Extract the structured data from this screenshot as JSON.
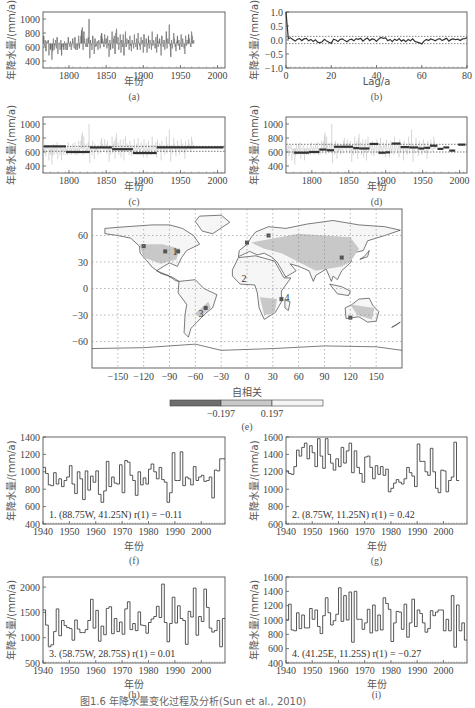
{
  "figure_caption": "图1.6  年降水量变化过程及分析(Sun et al., 2010)",
  "chart_data": [
    {
      "id": "a",
      "type": "bar",
      "subtitle": "(a)",
      "title": "",
      "xlabel": "年份",
      "ylabel": "年降水量/(mm/a)",
      "xlim": [
        1765,
        2010
      ],
      "ylim": [
        300,
        1100
      ],
      "xticks": [
        1800,
        1850,
        1900,
        1950,
        2000
      ],
      "yticks": [
        400,
        600,
        800,
        1000
      ],
      "baseline": 650,
      "x_start": 1766,
      "values": [
        760,
        620,
        700,
        540,
        680,
        660,
        700,
        480,
        640,
        560,
        580,
        420,
        540,
        720,
        560,
        620,
        700,
        580,
        740,
        500,
        640,
        660,
        560,
        700,
        480,
        640,
        600,
        560,
        680,
        620,
        560,
        660,
        560,
        740,
        640,
        600,
        680,
        560,
        620,
        720,
        660,
        580,
        740,
        560,
        640,
        560,
        620,
        760,
        580,
        660,
        760,
        840,
        880,
        560,
        820,
        720,
        640,
        600,
        720,
        600,
        740,
        1000,
        440,
        700,
        620,
        560,
        760,
        640,
        500,
        720,
        600,
        620,
        680,
        560,
        700,
        660,
        580,
        760,
        800,
        720,
        680,
        600,
        780,
        640,
        720,
        580,
        760,
        620,
        460,
        700,
        560,
        660,
        820,
        580,
        720,
        760,
        500,
        800,
        860,
        640,
        740,
        560,
        640,
        780,
        520,
        700,
        600,
        780,
        480,
        660,
        820,
        600,
        720,
        640,
        700,
        560,
        760,
        620,
        540,
        700,
        660,
        580,
        780,
        640,
        600,
        720,
        560,
        800,
        680,
        620,
        560,
        740,
        640,
        700,
        520,
        780,
        600,
        660,
        720,
        520,
        620,
        760,
        580,
        700,
        640,
        560,
        820,
        620,
        700,
        660,
        580,
        740,
        520,
        780,
        600,
        680,
        720,
        620,
        480,
        760,
        660,
        600,
        700,
        560,
        640,
        820,
        580,
        720,
        660,
        920,
        620,
        460,
        700,
        580,
        660,
        800,
        720,
        600,
        540,
        680,
        760,
        620,
        700,
        560,
        640,
        780,
        600,
        720,
        660,
        580,
        500,
        760,
        620,
        700,
        640,
        780,
        720,
        640,
        600,
        820,
        760,
        680,
        700
      ]
    },
    {
      "id": "b",
      "type": "line",
      "subtitle": "(b)",
      "title": "",
      "xlabel": "Lag/a",
      "ylabel": "年降水量/(mm/a)",
      "xlim": [
        0,
        80
      ],
      "ylim": [
        -1.0,
        1.0
      ],
      "xticks": [
        0,
        20,
        40,
        60,
        80
      ],
      "yticks": [
        -1.0,
        -0.5,
        0.0,
        0.5,
        1.0
      ],
      "ytick_labels": [
        "−1.0",
        "−0.5",
        "0.0",
        "0.5",
        "1.0"
      ],
      "confidence_band": [
        -0.13,
        0.13
      ],
      "values": [
        1.0,
        0.05,
        0.08,
        0.02,
        -0.04,
        0.03,
        0.05,
        -0.02,
        0.04,
        0.06,
        -0.03,
        0.02,
        -0.05,
        0.01,
        -0.08,
        -0.1,
        -0.06,
        0.02,
        -0.04,
        -0.08,
        -0.12,
        0.03,
        0.0,
        -0.05,
        0.02,
        0.04,
        -0.02,
        -0.06,
        0.01,
        0.03,
        -0.03,
        0.05,
        0.02,
        0.06,
        -0.04,
        0.03,
        0.07,
        -0.02,
        0.04,
        0.02,
        -0.05,
        0.04,
        0.09,
        0.06,
        0.08,
        -0.03,
        0.02,
        -0.06,
        0.03,
        -0.02,
        0.05,
        -0.04,
        0.01,
        -0.06,
        0.02,
        -0.03,
        0.04,
        -0.05,
        -0.08,
        -0.1,
        -0.14,
        -0.04,
        0.02,
        -0.02,
        0.04,
        0.01,
        -0.03,
        0.03,
        0.05,
        -0.02,
        0.02,
        0.06,
        -0.04,
        0.02,
        0.04,
        0.01,
        0.03,
        -0.02,
        0.04,
        0.05,
        0.08
      ]
    },
    {
      "id": "c",
      "type": "bar",
      "subtitle": "(c)",
      "xlabel": "年份",
      "ylabel": "年降水量/(mm/a)",
      "xlim": [
        1765,
        2010
      ],
      "ylim": [
        300,
        1100
      ],
      "xticks": [
        1800,
        1850,
        1900,
        1950,
        2000
      ],
      "yticks": [
        400,
        600,
        800,
        1000
      ],
      "reference_lines": [
        610,
        680
      ],
      "segments": [
        {
          "x0": 1766,
          "x1": 1796,
          "mean": 680
        },
        {
          "x0": 1796,
          "x1": 1828,
          "mean": 600
        },
        {
          "x0": 1828,
          "x1": 1858,
          "mean": 665
        },
        {
          "x0": 1858,
          "x1": 1886,
          "mean": 640
        },
        {
          "x0": 1886,
          "x1": 1918,
          "mean": 585
        },
        {
          "x0": 1918,
          "x1": 2008,
          "mean": 665
        }
      ]
    },
    {
      "id": "d",
      "type": "bar",
      "subtitle": "(d)",
      "xlabel": "年份",
      "ylabel": "年降水量/(mm/a)",
      "xlim": [
        1765,
        2010
      ],
      "ylim": [
        300,
        1100
      ],
      "xticks": [
        1800,
        1850,
        1900,
        1950,
        2000
      ],
      "yticks": [
        400,
        600,
        800,
        1000
      ],
      "reference_lines": [
        600,
        710
      ],
      "segments": [
        {
          "x0": 1776,
          "x1": 1796,
          "mean": 590
        },
        {
          "x0": 1796,
          "x1": 1810,
          "mean": 600
        },
        {
          "x0": 1810,
          "x1": 1820,
          "mean": 635
        },
        {
          "x0": 1820,
          "x1": 1830,
          "mean": 625
        },
        {
          "x0": 1830,
          "x1": 1856,
          "mean": 675
        },
        {
          "x0": 1856,
          "x1": 1864,
          "mean": 655
        },
        {
          "x0": 1864,
          "x1": 1878,
          "mean": 650
        },
        {
          "x0": 1878,
          "x1": 1890,
          "mean": 715
        },
        {
          "x0": 1890,
          "x1": 1900,
          "mean": 590
        },
        {
          "x0": 1900,
          "x1": 1906,
          "mean": 595
        },
        {
          "x0": 1908,
          "x1": 1920,
          "mean": 720
        },
        {
          "x0": 1920,
          "x1": 1932,
          "mean": 670
        },
        {
          "x0": 1932,
          "x1": 1944,
          "mean": 665
        },
        {
          "x0": 1944,
          "x1": 1952,
          "mean": 650
        },
        {
          "x0": 1952,
          "x1": 1960,
          "mean": 660
        },
        {
          "x0": 1960,
          "x1": 1970,
          "mean": 690
        },
        {
          "x0": 1970,
          "x1": 1978,
          "mean": 645
        },
        {
          "x0": 1978,
          "x1": 1986,
          "mean": 665
        },
        {
          "x0": 1986,
          "x1": 1994,
          "mean": 620
        },
        {
          "x0": 1998,
          "x1": 2008,
          "mean": 705
        }
      ]
    },
    {
      "id": "e",
      "type": "heatmap",
      "subtitle": "(e)",
      "xlabel": "自相关",
      "ylabel": "",
      "xlim": [
        -180,
        180
      ],
      "ylim": [
        -90,
        90
      ],
      "xticks": [
        -150,
        -120,
        -90,
        -60,
        -30,
        0,
        30,
        60,
        90,
        120,
        150
      ],
      "yticks": [
        -60,
        -30,
        0,
        30,
        60
      ],
      "ytick_labels": [
        "−60",
        "−30",
        "0",
        "30",
        "60"
      ],
      "xtick_labels": [
        "−150",
        "−120",
        "−90",
        "−60",
        "−30",
        "0",
        "30",
        "60",
        "90",
        "120",
        "150"
      ],
      "grid": true,
      "colorbar": {
        "thresholds": [
          "−0.197",
          "0.197"
        ],
        "colors": [
          "#6e6e6e",
          "#c8c8c8",
          "#f4f4f4"
        ]
      },
      "site_labels": [
        {
          "label": "1",
          "lon": -88.75,
          "lat": 41.25
        },
        {
          "label": "2",
          "lon": -8.75,
          "lat": 11.25
        },
        {
          "label": "3",
          "lon": -58.75,
          "lat": -28.75
        },
        {
          "label": "4",
          "lon": 41.25,
          "lat": -11.25
        }
      ]
    },
    {
      "id": "f",
      "type": "line",
      "subtitle": "(f)",
      "xlabel": "年份",
      "ylabel": "年降水量/(mm/a)",
      "xlim": [
        1940,
        2009
      ],
      "ylim": [
        400,
        1400
      ],
      "xticks": [
        1940,
        1950,
        1960,
        1970,
        1980,
        1990,
        2000
      ],
      "yticks": [
        400,
        600,
        800,
        1000,
        1200,
        1400
      ],
      "annotation": "1. (88.75W,  41.25N)  r(1) = −0.11",
      "x_start": 1940,
      "values": [
        1050,
        980,
        850,
        840,
        990,
        860,
        920,
        830,
        900,
        940,
        1070,
        860,
        750,
        1000,
        920,
        680,
        1010,
        790,
        950,
        880,
        1010,
        740,
        650,
        780,
        1120,
        830,
        940,
        870,
        860,
        1080,
        760,
        1130,
        1110,
        960,
        900,
        730,
        1000,
        850,
        930,
        860,
        1030,
        1090,
        1000,
        920,
        1050,
        910,
        880,
        650,
        760,
        1220,
        900,
        900,
        1230,
        840,
        940,
        920,
        850,
        1060,
        900,
        940,
        960,
        890,
        900,
        940,
        700,
        1020,
        1010,
        1150,
        1150
      ]
    },
    {
      "id": "g",
      "type": "line",
      "subtitle": "(g)",
      "xlabel": "年份",
      "ylabel": "年降水量/(mm/a)",
      "xlim": [
        1940,
        2009
      ],
      "ylim": [
        600,
        1600
      ],
      "xticks": [
        1940,
        1950,
        1960,
        1970,
        1980,
        1990,
        2000
      ],
      "yticks": [
        600,
        800,
        1000,
        1200,
        1400,
        1600
      ],
      "annotation": "2. (8.75W,  11.25N)  r(1) = 0.42",
      "x_start": 1940,
      "values": [
        1210,
        1180,
        1170,
        1260,
        1450,
        1380,
        1480,
        1530,
        1350,
        1500,
        1420,
        1260,
        1580,
        1380,
        1240,
        1580,
        1400,
        1300,
        1220,
        1350,
        1260,
        1480,
        1300,
        1440,
        1530,
        1190,
        1440,
        1250,
        1180,
        1080,
        1370,
        1380,
        1250,
        1120,
        1270,
        1170,
        1260,
        1160,
        1230,
        970,
        1010,
        1070,
        1110,
        1080,
        1060,
        1120,
        1250,
        1190,
        1150,
        1030,
        1520,
        1320,
        1320,
        1200,
        1160,
        1470,
        1200,
        1010,
        960,
        1220,
        1210,
        970,
        1100,
        1140,
        1540,
        1100
      ]
    },
    {
      "id": "h",
      "type": "line",
      "subtitle": "(h)",
      "xlabel": "年份",
      "ylabel": "年降水量/(mm/a)",
      "xlim": [
        1940,
        2009
      ],
      "ylim": [
        500,
        2200
      ],
      "xticks": [
        1940,
        1950,
        1960,
        1970,
        1980,
        1990,
        2000
      ],
      "yticks": [
        500,
        1000,
        1500,
        2000
      ],
      "annotation": "3. (58.75W,  28.75S)  r(1) = 0.01",
      "x_start": 1940,
      "values": [
        1550,
        1250,
        820,
        860,
        1120,
        1570,
        1040,
        1340,
        1240,
        1200,
        1180,
        950,
        1350,
        1170,
        1100,
        1100,
        1160,
        1340,
        1760,
        1190,
        1540,
        930,
        1230,
        1060,
        1580,
        1610,
        1080,
        1380,
        1120,
        1310,
        1070,
        1570,
        1710,
        1160,
        1280,
        1140,
        1510,
        1250,
        1240,
        1090,
        1300,
        1370,
        1420,
        1620,
        1400,
        2060,
        1300,
        920,
        1280,
        1800,
        1290,
        1630,
        1380,
        1340,
        870,
        1520,
        1410,
        1980,
        1050,
        1420,
        1320,
        1960,
        1600,
        1190,
        1110,
        1140,
        1340,
        820,
        1380
      ]
    },
    {
      "id": "i",
      "type": "line",
      "subtitle": "(i)",
      "xlabel": "年份",
      "ylabel": "年降水量/(mm/a)",
      "xlim": [
        1940,
        2009
      ],
      "ylim": [
        400,
        1600
      ],
      "xticks": [
        1940,
        1950,
        1960,
        1970,
        1980,
        1990,
        2000
      ],
      "yticks": [
        400,
        600,
        800,
        1000,
        1200,
        1400,
        1600
      ],
      "annotation": "4. (41.25E,  11.25S)  r(1) = −0.27",
      "x_start": 1940,
      "values": [
        1000,
        1220,
        860,
        850,
        1100,
        880,
        1070,
        890,
        890,
        1160,
        1010,
        1140,
        910,
        810,
        1060,
        1310,
        1100,
        930,
        990,
        1080,
        1450,
        980,
        1340,
        1000,
        1390,
        690,
        1400,
        1010,
        1010,
        870,
        960,
        1150,
        820,
        1210,
        850,
        1070,
        860,
        1310,
        1230,
        1150,
        700,
        960,
        1120,
        1110,
        870,
        1220,
        760,
        960,
        1290,
        910,
        1140,
        1090,
        960,
        830,
        880,
        1130,
        1060,
        1110,
        1140,
        1140,
        850,
        1010,
        850,
        1340,
        620,
        1210,
        850,
        960,
        720
      ]
    }
  ]
}
